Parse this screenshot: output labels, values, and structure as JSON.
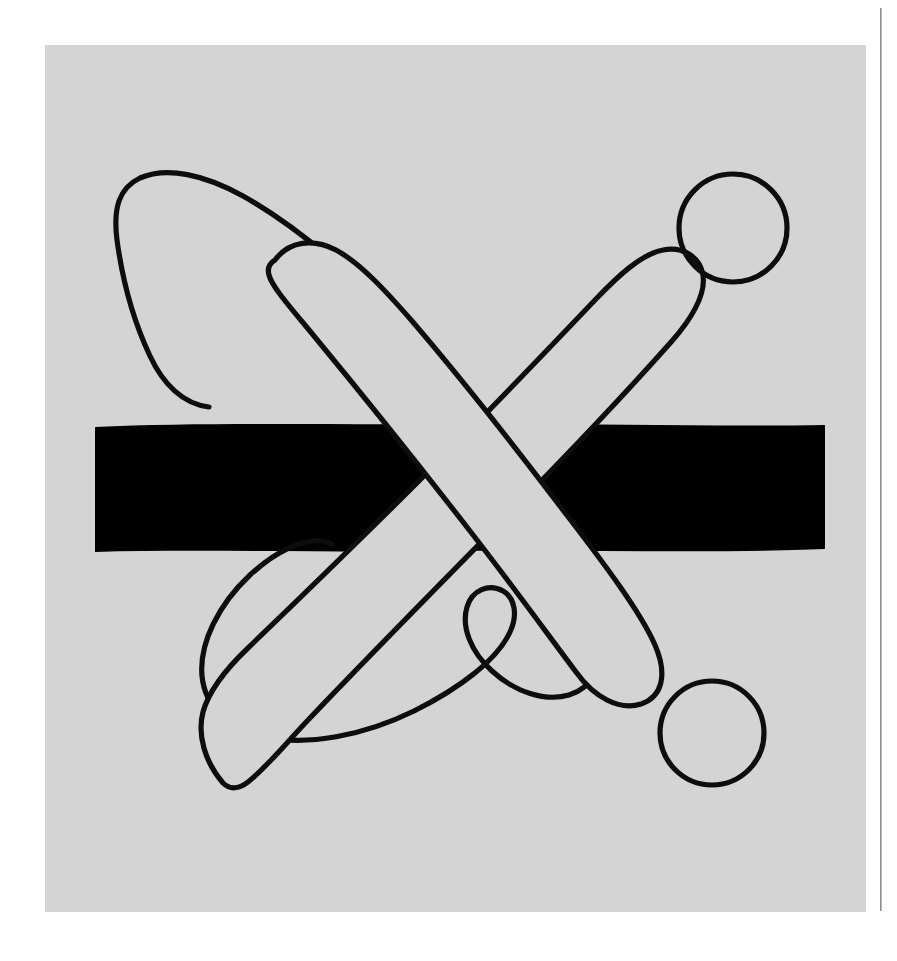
{
  "page": {
    "title": "Abstract Line Drawing",
    "width": 897,
    "height": 961,
    "paper_color": "#ffffff"
  },
  "canvas": {
    "name": "artwork-canvas",
    "fill_color": "#d4d4d4",
    "x": 45,
    "y": 45,
    "width": 821,
    "height": 867
  },
  "page_edge_rule": {
    "name": "page-edge-rule",
    "color": "#8e8e8e",
    "x": 880,
    "y": 8,
    "width": 1.6,
    "height": 903
  },
  "ink": {
    "stroke_color": "#0d0d0d",
    "fill_color": "#d4d4d4",
    "bar_color": "#000000",
    "outline_width": 5.2
  },
  "shapes": [
    {
      "name": "black-bar",
      "type": "rect",
      "label": "Horizontal black bar",
      "x": 95,
      "y": 424,
      "width": 730,
      "height": 128,
      "fill": "#000000"
    },
    {
      "name": "outlined-arch-loop",
      "type": "open-outline-curve",
      "label": "Large arched loop with inner notch and lower hook",
      "fill": "none",
      "stroke": "#0d0d0d"
    },
    {
      "name": "thick-stroke-rising",
      "type": "rounded-band",
      "label": "Thick rounded band rising left-to-right",
      "fill": "#d4d4d4",
      "stroke": "#0d0d0d"
    },
    {
      "name": "thick-stroke-falling",
      "type": "rounded-band",
      "label": "Thick rounded band falling left-to-right",
      "fill": "#d4d4d4",
      "stroke": "#0d0d0d"
    },
    {
      "name": "circle-upper-right",
      "type": "circle",
      "label": "Upper right outlined circle",
      "cx": 733,
      "cy": 228,
      "r": 54,
      "fill": "none",
      "stroke": "#0d0d0d"
    },
    {
      "name": "circle-lower-right",
      "type": "circle",
      "label": "Lower right outlined circle",
      "cx": 712,
      "cy": 733,
      "r": 52,
      "fill": "none",
      "stroke": "#0d0d0d"
    }
  ]
}
